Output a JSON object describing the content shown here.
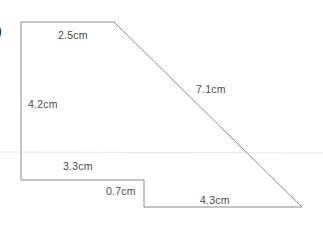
{
  "diagram": {
    "type": "compound-shape",
    "question_marker": ")",
    "colors": {
      "outline": "#8a8a8a",
      "label_text": "#4a4a4a",
      "background": "#ffffff",
      "faint_rule": "#e6e6e6"
    },
    "labels": {
      "top_edge": "2.5cm",
      "slanted_edge": "7.1cm",
      "left_edge": "4.2cm",
      "lower_left_edge": "3.3cm",
      "step_edge": "0.7cm",
      "bottom_edge": "4.3cm"
    },
    "vertices": [
      {
        "name": "top-left",
        "x": 21,
        "y": 22
      },
      {
        "name": "top-right",
        "x": 114,
        "y": 22
      },
      {
        "name": "bottom-right",
        "x": 302,
        "y": 207
      },
      {
        "name": "step-bottom",
        "x": 144,
        "y": 207
      },
      {
        "name": "step-top",
        "x": 144,
        "y": 180
      },
      {
        "name": "bottom-left",
        "x": 21,
        "y": 180
      }
    ]
  }
}
